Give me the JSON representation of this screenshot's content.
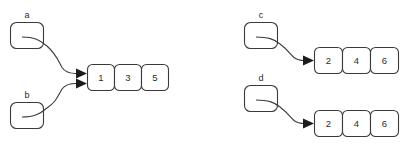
{
  "diagram": {
    "background_color": "#ffffff",
    "stroke_color": "#3a3a3a",
    "text_color": "#2b2b2b",
    "arrow_color": "#1c1c1c"
  },
  "pointers": [
    {
      "label": "a",
      "target": "list-left"
    },
    {
      "label": "b",
      "target": "list-left"
    },
    {
      "label": "c",
      "target": "list-top-right"
    },
    {
      "label": "d",
      "target": "list-bottom-right"
    }
  ],
  "lists": [
    {
      "id": "list-left",
      "cells": [
        "1",
        "3",
        "5"
      ]
    },
    {
      "id": "list-top-right",
      "cells": [
        "2",
        "4",
        "6"
      ]
    },
    {
      "id": "list-bottom-right",
      "cells": [
        "2",
        "4",
        "6"
      ]
    }
  ]
}
